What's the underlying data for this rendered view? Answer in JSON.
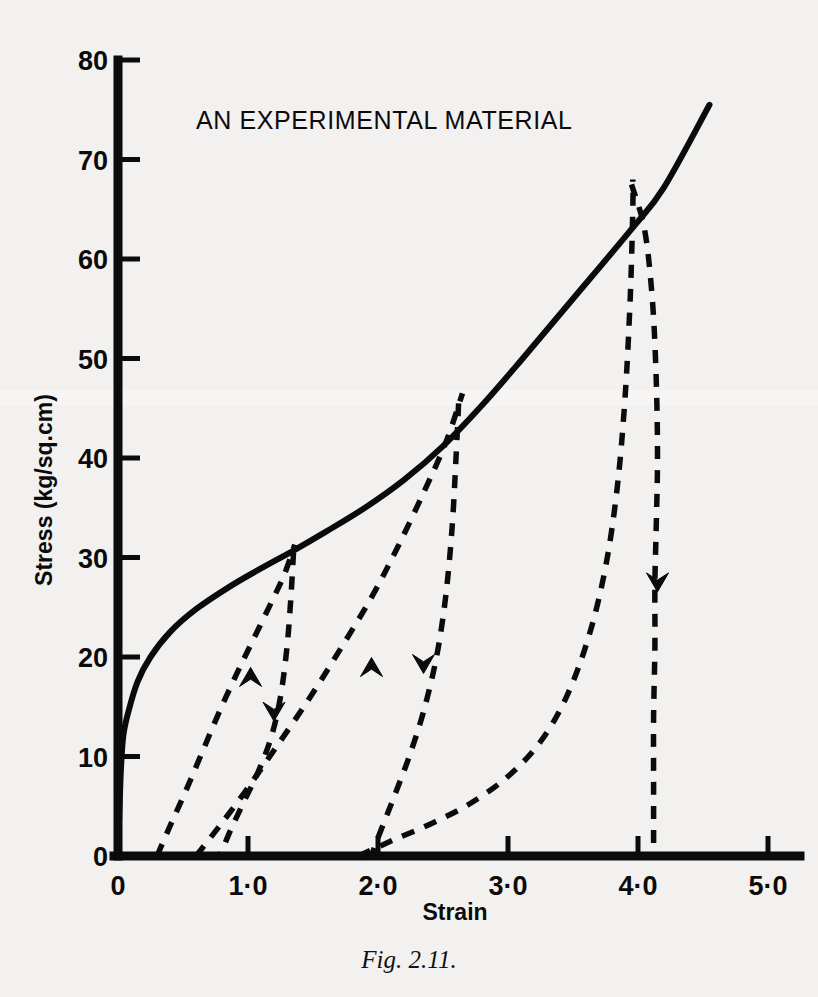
{
  "figure": {
    "caption": "Fig. 2.11.",
    "background_color": "#f2f1ef",
    "ink_color": "#0b0b0b"
  },
  "chart_data": {
    "type": "line",
    "title": "AN EXPERIMENTAL MATERIAL",
    "xlabel": "Strain",
    "ylabel": "Stress (kg/sq.cm)",
    "xlim": [
      0,
      5.4
    ],
    "ylim": [
      0,
      80
    ],
    "grid": false,
    "legend": "none",
    "xticks": [
      0,
      1,
      2,
      3,
      4,
      5
    ],
    "xticklabels": [
      "0",
      "1·0",
      "2·0",
      "3·0",
      "4·0",
      "5·0"
    ],
    "yticks": [
      0,
      10,
      20,
      30,
      40,
      50,
      60,
      70,
      80
    ],
    "yticklabels": [
      "0",
      "10",
      "20",
      "30",
      "40",
      "50",
      "60",
      "70",
      "80"
    ],
    "series": [
      {
        "name": "monotonic-envelope",
        "style": "solid",
        "description": "Primary loading envelope curve: steep elastic rise, yield knee near 12 kg/sq.cm, concave hardening then near-linear rise",
        "points": [
          [
            0.0,
            0.0
          ],
          [
            0.02,
            8.0
          ],
          [
            0.04,
            12.0
          ],
          [
            0.08,
            14.5
          ],
          [
            0.15,
            17.5
          ],
          [
            0.25,
            20.0
          ],
          [
            0.4,
            22.5
          ],
          [
            0.6,
            24.8
          ],
          [
            0.85,
            27.0
          ],
          [
            1.1,
            28.9
          ],
          [
            1.35,
            30.7
          ],
          [
            1.6,
            32.6
          ],
          [
            1.9,
            35.0
          ],
          [
            2.2,
            37.8
          ],
          [
            2.5,
            41.2
          ],
          [
            2.8,
            45.3
          ],
          [
            3.1,
            49.8
          ],
          [
            3.5,
            56.0
          ],
          [
            3.95,
            63.0
          ],
          [
            4.2,
            67.2
          ],
          [
            4.55,
            75.5
          ]
        ]
      },
      {
        "name": "cycle-1-unload",
        "style": "dashed",
        "arrow": "down",
        "peak": [
          1.35,
          30.5
        ],
        "residual_strain": 0.78,
        "description": "First unloading branch from 30.5 kg/sq.cm down to zero stress at strain 0.78",
        "points": [
          [
            1.35,
            30.5
          ],
          [
            1.33,
            26.0
          ],
          [
            1.3,
            21.0
          ],
          [
            1.25,
            16.0
          ],
          [
            1.18,
            12.0
          ],
          [
            1.08,
            8.5
          ],
          [
            0.97,
            5.5
          ],
          [
            0.88,
            3.0
          ],
          [
            0.82,
            1.2
          ],
          [
            0.78,
            0.0
          ]
        ]
      },
      {
        "name": "cycle-1-reload",
        "style": "dashed",
        "arrow": "up",
        "description": "First reloading branch from residual strain 0.30 back up to the envelope at 1.35",
        "points": [
          [
            0.3,
            0.0
          ],
          [
            0.4,
            3.0
          ],
          [
            0.52,
            6.5
          ],
          [
            0.65,
            10.5
          ],
          [
            0.78,
            14.5
          ],
          [
            0.92,
            18.5
          ],
          [
            1.05,
            22.0
          ],
          [
            1.18,
            25.5
          ],
          [
            1.28,
            28.3
          ],
          [
            1.36,
            31.3
          ]
        ]
      },
      {
        "name": "cycle-2-unload",
        "style": "dashed",
        "arrow": "down",
        "peak": [
          2.62,
          45.5
        ],
        "residual_strain": 1.95,
        "description": "Second unloading branch from 45.5 kg/sq.cm down to zero stress at strain 1.95",
        "points": [
          [
            2.62,
            45.5
          ],
          [
            2.6,
            40.0
          ],
          [
            2.57,
            33.0
          ],
          [
            2.52,
            26.0
          ],
          [
            2.45,
            20.0
          ],
          [
            2.35,
            14.5
          ],
          [
            2.24,
            10.0
          ],
          [
            2.14,
            6.5
          ],
          [
            2.05,
            3.5
          ],
          [
            1.99,
            1.5
          ],
          [
            1.95,
            0.0
          ]
        ]
      },
      {
        "name": "cycle-2-reload",
        "style": "dashed",
        "arrow": "up",
        "description": "Second reloading branch from residual strain 0.60 back up to the envelope at 2.62",
        "points": [
          [
            0.6,
            0.0
          ],
          [
            0.78,
            3.0
          ],
          [
            0.98,
            6.5
          ],
          [
            1.22,
            11.0
          ],
          [
            1.48,
            16.0
          ],
          [
            1.72,
            21.0
          ],
          [
            1.95,
            26.0
          ],
          [
            2.15,
            31.0
          ],
          [
            2.35,
            36.5
          ],
          [
            2.52,
            41.5
          ],
          [
            2.65,
            46.5
          ]
        ]
      },
      {
        "name": "cycle-3-unload",
        "style": "dashed",
        "arrow": "down",
        "peak": [
          3.95,
          67.5
        ],
        "residual_strain": 4.12,
        "description": "Third unloading branch from the peak 67.5 kg/sq.cm dropping steeply to zero stress near strain 4.12",
        "points": [
          [
            3.95,
            67.5
          ],
          [
            4.05,
            63.0
          ],
          [
            4.11,
            56.0
          ],
          [
            4.14,
            48.0
          ],
          [
            4.15,
            40.0
          ],
          [
            4.14,
            33.0
          ],
          [
            4.13,
            27.5
          ],
          [
            4.13,
            21.0
          ],
          [
            4.12,
            14.0
          ],
          [
            4.12,
            7.0
          ],
          [
            4.12,
            0.0
          ]
        ]
      },
      {
        "name": "cycle-3-reload",
        "style": "dashed",
        "arrow": "none",
        "description": "Third reloading branch rising from residual strain 1.85 up the steep flank to the peak at 3.95",
        "points": [
          [
            1.85,
            0.0
          ],
          [
            2.1,
            1.5
          ],
          [
            2.4,
            3.2
          ],
          [
            2.7,
            5.2
          ],
          [
            3.0,
            8.0
          ],
          [
            3.25,
            11.5
          ],
          [
            3.45,
            16.0
          ],
          [
            3.62,
            22.0
          ],
          [
            3.75,
            29.0
          ],
          [
            3.84,
            37.0
          ],
          [
            3.9,
            46.0
          ],
          [
            3.94,
            56.0
          ],
          [
            3.96,
            65.0
          ],
          [
            3.96,
            68.0
          ]
        ]
      }
    ],
    "annotations": [
      {
        "name": "arrow-cycle1-reload-up",
        "at": [
          1.02,
          18.0
        ],
        "direction": "up"
      },
      {
        "name": "arrow-cycle1-unload-down",
        "at": [
          1.2,
          14.5
        ],
        "direction": "down"
      },
      {
        "name": "arrow-cycle2-reload-up",
        "at": [
          1.95,
          19.0
        ],
        "direction": "up"
      },
      {
        "name": "arrow-cycle2-unload-down",
        "at": [
          2.35,
          19.3
        ],
        "direction": "down"
      },
      {
        "name": "arrow-cycle3-unload-down",
        "at": [
          4.15,
          27.5
        ],
        "direction": "down"
      }
    ]
  }
}
